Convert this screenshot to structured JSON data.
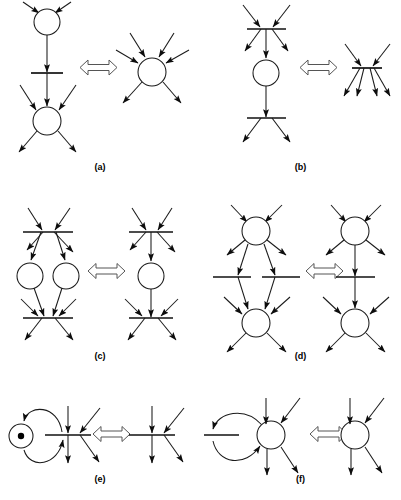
{
  "figure": {
    "background_color": "#ffffff",
    "stroke_color": "#1a1a1a",
    "equiv_symbol": "double-headed-arrow",
    "width": 401,
    "height": 500
  },
  "panels": [
    {
      "id": "a",
      "caption": "(a)",
      "left": {
        "description": "Two places connected by a transition bar in series",
        "nodes": [
          {
            "type": "place",
            "id": "p-top",
            "cx": 47,
            "cy": 22,
            "r": 13
          },
          {
            "type": "bar",
            "id": "t-mid",
            "cx": 47,
            "cy": 73,
            "half_width": 16
          },
          {
            "type": "place",
            "id": "p-bottom",
            "cx": 47,
            "cy": 121,
            "r": 14
          }
        ],
        "arcs_in_top": 2,
        "arcs_in_bottom": 2,
        "arcs_out_bottom": 2,
        "internal_arcs": 2
      },
      "right": {
        "description": "Single merged place with three inputs and two outputs",
        "nodes": [
          {
            "type": "place",
            "id": "p-merged",
            "cx": 152,
            "cy": 72,
            "r": 14
          }
        ],
        "arcs_in": 3,
        "arcs_out": 2
      }
    },
    {
      "id": "b",
      "caption": "(b)",
      "left": {
        "description": "Transition bar, place, transition bar in series",
        "nodes": [
          {
            "type": "bar",
            "id": "t-top",
            "cx": 266,
            "cy": 29,
            "half_width": 19
          },
          {
            "type": "place",
            "id": "p-mid",
            "cx": 266,
            "cy": 73,
            "r": 13
          },
          {
            "type": "bar",
            "id": "t-bottom",
            "cx": 266,
            "cy": 118,
            "half_width": 19
          }
        ],
        "arcs_in_top": 2,
        "arcs_out_top": 2,
        "arcs_out_bottom": 2,
        "internal_arcs": 2
      },
      "right": {
        "description": "Single merged transition bar with two inputs and four outputs",
        "nodes": [
          {
            "type": "bar",
            "id": "t-merged",
            "cx": 367,
            "cy": 68,
            "half_width": 15
          }
        ],
        "arcs_in": 2,
        "arcs_out": 4
      }
    },
    {
      "id": "c",
      "caption": "(c)",
      "left": {
        "description": "Transition bar feeding two parallel places which feed a lower transition bar",
        "nodes": [
          {
            "type": "bar",
            "id": "t-top",
            "cx": 48,
            "cy": 232,
            "half_width": 25
          },
          {
            "type": "place",
            "id": "p-left",
            "cx": 30,
            "cy": 276,
            "r": 13
          },
          {
            "type": "place",
            "id": "p-right",
            "cx": 66,
            "cy": 276,
            "r": 13
          },
          {
            "type": "bar",
            "id": "t-bottom",
            "cx": 48,
            "cy": 318,
            "half_width": 25
          }
        ],
        "arcs_in_top": 2,
        "arcs_out_top": 2,
        "arcs_in_bottom": 2,
        "arcs_out_bottom": 2,
        "internal_arcs": 4
      },
      "right": {
        "description": "Transition bar feeding one place feeding a lower transition bar",
        "nodes": [
          {
            "type": "bar",
            "id": "t-top",
            "cx": 151,
            "cy": 232,
            "half_width": 22
          },
          {
            "type": "place",
            "id": "p-mid",
            "cx": 151,
            "cy": 276,
            "r": 13
          },
          {
            "type": "bar",
            "id": "t-bottom",
            "cx": 151,
            "cy": 318,
            "half_width": 22
          }
        ],
        "arcs_in_top": 2,
        "arcs_out_top": 2,
        "arcs_in_bottom": 2,
        "arcs_out_bottom": 2,
        "internal_arcs": 2
      }
    },
    {
      "id": "d",
      "caption": "(d)",
      "left": {
        "description": "Place feeding two parallel transition bars which feed a lower place",
        "nodes": [
          {
            "type": "place",
            "id": "p-top",
            "cx": 256,
            "cy": 231,
            "r": 14
          },
          {
            "type": "bar",
            "id": "t-left",
            "cx": 232,
            "cy": 277,
            "half_width": 19
          },
          {
            "type": "bar",
            "id": "t-right",
            "cx": 281,
            "cy": 277,
            "half_width": 19
          },
          {
            "type": "place",
            "id": "p-bottom",
            "cx": 256,
            "cy": 323,
            "r": 14
          }
        ],
        "arcs_in_top": 2,
        "arcs_out_top": 2,
        "arcs_in_bottom": 2,
        "arcs_out_bottom": 2,
        "internal_arcs": 4
      },
      "right": {
        "description": "Place feeding one transition bar feeding a lower place",
        "nodes": [
          {
            "type": "place",
            "id": "p-top",
            "cx": 355,
            "cy": 231,
            "r": 14
          },
          {
            "type": "bar",
            "id": "t-mid",
            "cx": 355,
            "cy": 277,
            "half_width": 19
          },
          {
            "type": "place",
            "id": "p-bottom",
            "cx": 355,
            "cy": 323,
            "r": 14
          }
        ],
        "arcs_in_top": 2,
        "arcs_out_top": 2,
        "arcs_in_bottom": 2,
        "arcs_out_bottom": 2,
        "internal_arcs": 2
      }
    },
    {
      "id": "e",
      "caption": "(e)",
      "left": {
        "description": "Marked place with a token in a self-loop pair of arcs to a transition bar",
        "nodes": [
          {
            "type": "place",
            "id": "p-marked",
            "cx": 21,
            "cy": 436,
            "r": 12,
            "token": true
          },
          {
            "type": "bar",
            "id": "t-main",
            "cx": 68,
            "cy": 435,
            "half_width": 23
          }
        ],
        "loop_arcs": 2,
        "arcs_in": 2,
        "arcs_out": 2
      },
      "right": {
        "description": "Transition bar alone with two inputs and two outputs",
        "nodes": [
          {
            "type": "bar",
            "id": "t-main",
            "cx": 152,
            "cy": 435,
            "half_width": 23
          }
        ],
        "arcs_in": 2,
        "arcs_out": 2
      }
    },
    {
      "id": "f",
      "caption": "(f)",
      "left": {
        "description": "Place with a self-loop pair of arcs through an unmarked transition bar",
        "nodes": [
          {
            "type": "bar",
            "id": "t-loop",
            "cx": 220,
            "cy": 435,
            "half_width": 18
          },
          {
            "type": "place",
            "id": "p-main",
            "cx": 271,
            "cy": 435,
            "r": 14
          }
        ],
        "loop_arcs": 2,
        "arcs_in": 2,
        "arcs_out": 2
      },
      "right": {
        "description": "Place alone with two inputs and two outputs",
        "nodes": [
          {
            "type": "place",
            "id": "p-main",
            "cx": 355,
            "cy": 435,
            "r": 14
          }
        ],
        "arcs_in": 2,
        "arcs_out": 2
      }
    }
  ],
  "captions": {
    "a": "(a)",
    "b": "(b)",
    "c": "(c)",
    "d": "(d)",
    "e": "(e)",
    "f": "(f)"
  }
}
